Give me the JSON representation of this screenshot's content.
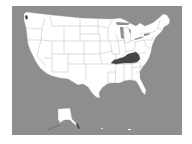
{
  "map": {
    "title": "",
    "region": "United States",
    "highlighted_state": "Kentucky",
    "colors": {
      "ocean": "#8e8e8e",
      "land": "#ffffff",
      "border": "#9a9a9a",
      "highlight": "#454545",
      "page_background": "#ffffff"
    },
    "insets": [
      "Alaska",
      "Hawaii"
    ]
  }
}
